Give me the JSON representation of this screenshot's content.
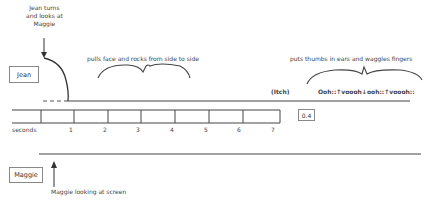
{
  "participants": {
    "jean": {
      "label": "Jean"
    },
    "maggie": {
      "label": "Maggie"
    }
  },
  "annotations": {
    "jean_turns": [
      "Jean turns",
      "and looks at",
      "Maggie"
    ],
    "pulls_face": "pulls face and rocks from side to side",
    "thumbs_ears": "puts thumbs in ears and waggles fingers",
    "itch": "(Itch)",
    "vocal": "Ooh::↑voooh↓ooh::↑voooh::",
    "maggie_looking": "Maggie looking at screen"
  },
  "timeline": {
    "unit_label": "seconds",
    "ticks": [
      "1",
      "2",
      "3",
      "4",
      "5",
      "6",
      "7"
    ],
    "pause_value": "0.4"
  }
}
